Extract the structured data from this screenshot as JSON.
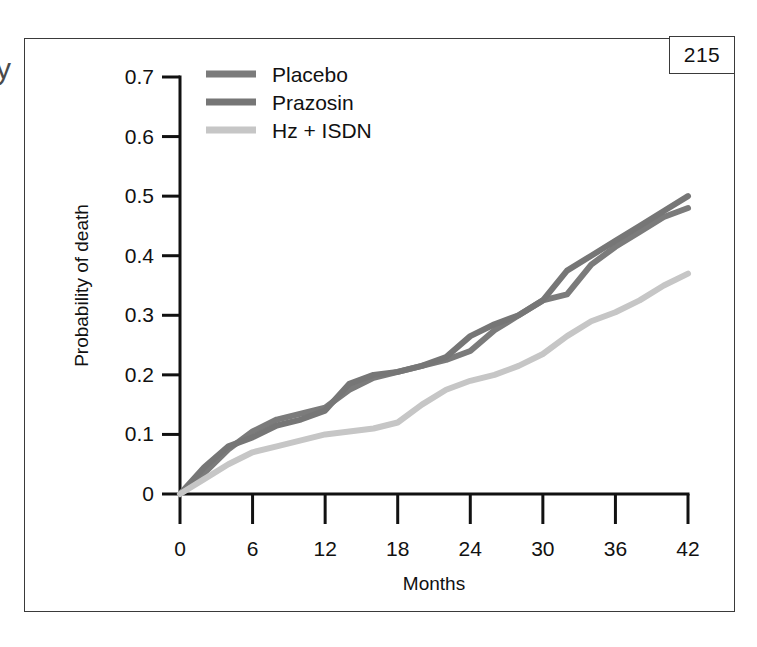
{
  "page": {
    "page_number": "215",
    "edge_glyph": "y"
  },
  "chart_data": {
    "type": "line",
    "title": "",
    "xlabel": "Months",
    "ylabel": "Probability of death",
    "xlim": [
      0,
      42
    ],
    "ylim": [
      0,
      0.7
    ],
    "x_ticks": [
      "0",
      "6",
      "12",
      "18",
      "24",
      "30",
      "36",
      "42"
    ],
    "x_tick_values": [
      0,
      6,
      12,
      18,
      24,
      30,
      36,
      42
    ],
    "y_ticks": [
      "0",
      "0.1",
      "0.2",
      "0.3",
      "0.4",
      "0.5",
      "0.6",
      "0.7"
    ],
    "y_tick_values": [
      0,
      0.1,
      0.2,
      0.3,
      0.4,
      0.5,
      0.6,
      0.7
    ],
    "grid": false,
    "legend_position": "top-left",
    "colors": {
      "placebo": "#7b7b7b",
      "prazosin": "#767676",
      "hz_isdn": "#c6c6c6",
      "axis": "#111111",
      "frame": "#3a3a3a"
    },
    "series": [
      {
        "name": "Placebo",
        "color": "#7b7b7b",
        "x": [
          0,
          2,
          4,
          6,
          8,
          10,
          12,
          14,
          16,
          18,
          20,
          22,
          24,
          26,
          28,
          30,
          32,
          34,
          36,
          38,
          40,
          42
        ],
        "values": [
          0.0,
          0.035,
          0.075,
          0.105,
          0.125,
          0.135,
          0.145,
          0.175,
          0.195,
          0.205,
          0.215,
          0.225,
          0.24,
          0.275,
          0.3,
          0.325,
          0.335,
          0.385,
          0.415,
          0.44,
          0.465,
          0.48
        ]
      },
      {
        "name": "Prazosin",
        "color": "#767676",
        "x": [
          0,
          2,
          4,
          6,
          8,
          10,
          12,
          14,
          16,
          18,
          20,
          22,
          24,
          26,
          28,
          30,
          32,
          34,
          36,
          38,
          40,
          42
        ],
        "values": [
          0.0,
          0.045,
          0.08,
          0.095,
          0.115,
          0.125,
          0.14,
          0.185,
          0.2,
          0.205,
          0.215,
          0.23,
          0.265,
          0.285,
          0.3,
          0.325,
          0.375,
          0.4,
          0.425,
          0.45,
          0.475,
          0.5
        ]
      },
      {
        "name": "Hz + ISDN",
        "color": "#c6c6c6",
        "x": [
          0,
          2,
          4,
          6,
          8,
          10,
          12,
          14,
          16,
          18,
          20,
          22,
          24,
          26,
          28,
          30,
          32,
          34,
          36,
          38,
          40,
          42
        ],
        "values": [
          0.0,
          0.025,
          0.05,
          0.07,
          0.08,
          0.09,
          0.1,
          0.105,
          0.11,
          0.12,
          0.15,
          0.175,
          0.19,
          0.2,
          0.215,
          0.235,
          0.265,
          0.29,
          0.305,
          0.325,
          0.35,
          0.37
        ]
      }
    ]
  }
}
